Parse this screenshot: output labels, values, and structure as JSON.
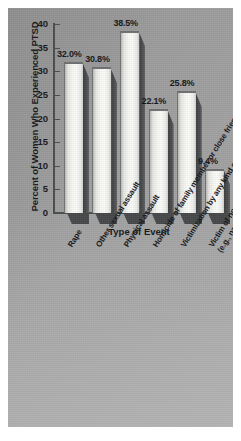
{
  "chart_data": {
    "type": "bar",
    "title": "",
    "xlabel": "Type of Event",
    "ylabel": "Percent of Women Who Experienced PTSD",
    "ylim": [
      0,
      40
    ],
    "yticks": [
      "0",
      "5",
      "10",
      "15",
      "20",
      "25",
      "30",
      "35",
      "40"
    ],
    "grid": false,
    "legend": null,
    "categories": [
      "Rape",
      "Other sexual assault",
      "Physical assault",
      "Homicide of family member or close friend",
      "Victimization by any kind of crime",
      "Victim of noncriminal trauma\n(e.g., natural disaster or accident)"
    ],
    "values": [
      32.0,
      30.8,
      38.5,
      22.1,
      25.8,
      9.4
    ],
    "data_labels": [
      "32.0%",
      "30.8%",
      "38.5%",
      "22.1%",
      "25.8%",
      "9.4%"
    ],
    "colors": {
      "background": "#9a9a9a",
      "bar_face": "#f7f7f4",
      "bar_shadow": "#434547",
      "axis": "#4a4c4e",
      "text": "#15171a"
    }
  }
}
